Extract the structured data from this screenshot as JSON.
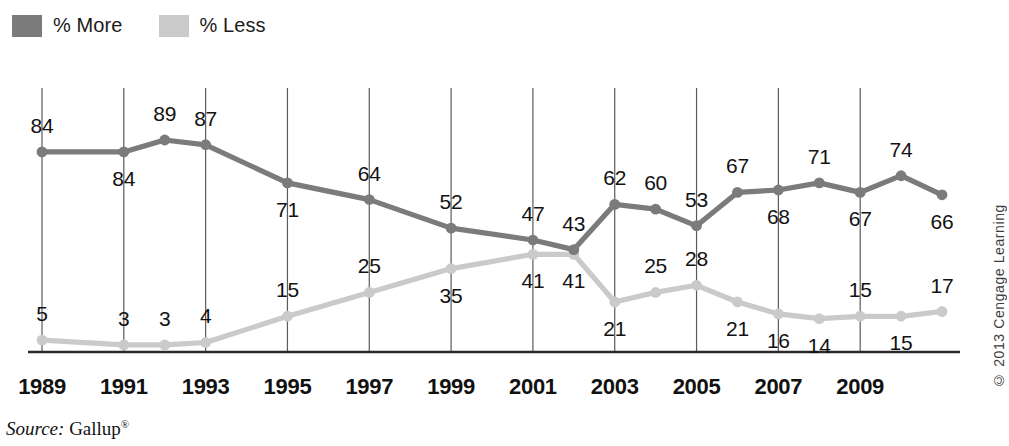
{
  "legend": {
    "items": [
      {
        "label": "% More",
        "color": "#7b7b7b",
        "icon": "legend-swatch-more"
      },
      {
        "label": "% Less",
        "color": "#cacaca",
        "icon": "legend-swatch-less"
      }
    ]
  },
  "credit": "© 2013 Cengage Learning",
  "source": {
    "prefix": "Source:",
    "name": "Gallup",
    "mark": "®"
  },
  "chart_data": {
    "type": "line",
    "title": "",
    "subtitle": "",
    "xlabel": "",
    "ylabel": "",
    "grid": "vertical-only",
    "legend_position": "top-left",
    "ylim": [
      0,
      100
    ],
    "x": [
      1989,
      1990,
      1991,
      1992,
      1993,
      1994,
      1995,
      1996,
      1997,
      1998,
      1999,
      2000,
      2001,
      2002,
      2003,
      2004,
      2005,
      2006,
      2007,
      2008,
      2009,
      2010,
      2011
    ],
    "tick_labels": [
      "1989",
      "1991",
      "1993",
      "1995",
      "1997",
      "1999",
      "2001",
      "2003",
      "2005",
      "2007",
      "2009"
    ],
    "tick_values": [
      1989,
      1991,
      1993,
      1995,
      1997,
      1999,
      2001,
      2003,
      2005,
      2007,
      2009
    ],
    "series": [
      {
        "name": "% More",
        "color": "#7b7b7b",
        "points": [
          {
            "x": 1989,
            "y": 84,
            "label": "84",
            "label_pos": "above"
          },
          {
            "x": 1991,
            "y": 84,
            "label": "84",
            "label_pos": "below"
          },
          {
            "x": 1992,
            "y": 89,
            "label": "89",
            "label_pos": "above"
          },
          {
            "x": 1993,
            "y": 87,
            "label": "87",
            "label_pos": "above"
          },
          {
            "x": 1995,
            "y": 71,
            "label": "71",
            "label_pos": "below"
          },
          {
            "x": 1997,
            "y": 64,
            "label": "64",
            "label_pos": "above"
          },
          {
            "x": 1999,
            "y": 52,
            "label": "52",
            "label_pos": "above"
          },
          {
            "x": 2001,
            "y": 47,
            "label": "47",
            "label_pos": "above"
          },
          {
            "x": 2002,
            "y": 43,
            "label": "43",
            "label_pos": "above"
          },
          {
            "x": 2003,
            "y": 62,
            "label": "62",
            "label_pos": "above"
          },
          {
            "x": 2004,
            "y": 60,
            "label": "60",
            "label_pos": "above"
          },
          {
            "x": 2005,
            "y": 53,
            "label": "53",
            "label_pos": "above"
          },
          {
            "x": 2006,
            "y": 67,
            "label": "67",
            "label_pos": "above"
          },
          {
            "x": 2007,
            "y": 68,
            "label": "68",
            "label_pos": "below"
          },
          {
            "x": 2008,
            "y": 71,
            "label": "71",
            "label_pos": "above"
          },
          {
            "x": 2009,
            "y": 67,
            "label": "67",
            "label_pos": "below"
          },
          {
            "x": 2010,
            "y": 74,
            "label": "74",
            "label_pos": "above"
          },
          {
            "x": 2011,
            "y": 66,
            "label": "66",
            "label_pos": "below"
          }
        ]
      },
      {
        "name": "% Less",
        "color": "#cacaca",
        "points": [
          {
            "x": 1989,
            "y": 5,
            "label": "5",
            "label_pos": "above"
          },
          {
            "x": 1991,
            "y": 3,
            "label": "3",
            "label_pos": "above"
          },
          {
            "x": 1992,
            "y": 3,
            "label": "3",
            "label_pos": "above"
          },
          {
            "x": 1993,
            "y": 4,
            "label": "4",
            "label_pos": "above"
          },
          {
            "x": 1995,
            "y": 15,
            "label": "15",
            "label_pos": "above"
          },
          {
            "x": 1997,
            "y": 25,
            "label": "25",
            "label_pos": "above"
          },
          {
            "x": 1999,
            "y": 35,
            "label": "35",
            "label_pos": "below"
          },
          {
            "x": 2001,
            "y": 41,
            "label": "41",
            "label_pos": "below"
          },
          {
            "x": 2002,
            "y": 41,
            "label": "41",
            "label_pos": "below"
          },
          {
            "x": 2003,
            "y": 21,
            "label": "21",
            "label_pos": "below"
          },
          {
            "x": 2004,
            "y": 25,
            "label": "25",
            "label_pos": "above"
          },
          {
            "x": 2005,
            "y": 28,
            "label": "28",
            "label_pos": "above"
          },
          {
            "x": 2006,
            "y": 21,
            "label": "21",
            "label_pos": "below"
          },
          {
            "x": 2007,
            "y": 16,
            "label": "16",
            "label_pos": "below"
          },
          {
            "x": 2008,
            "y": 14,
            "label": "14",
            "label_pos": "below"
          },
          {
            "x": 2009,
            "y": 15,
            "label": "15",
            "label_pos": "above"
          },
          {
            "x": 2010,
            "y": 15,
            "label": "15",
            "label_pos": "below"
          },
          {
            "x": 2011,
            "y": 17,
            "label": "17",
            "label_pos": "above"
          }
        ]
      }
    ]
  }
}
